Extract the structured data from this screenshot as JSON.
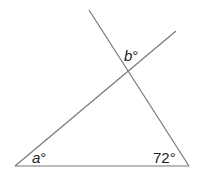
{
  "diagram": {
    "type": "geometry",
    "line_color": "#777777",
    "labels": {
      "a": "a",
      "b": "b",
      "angle_72": "72°",
      "degree": "°"
    },
    "lines": [
      {
        "name": "base",
        "x1": 15,
        "y1": 166,
        "x2": 189,
        "y2": 166
      },
      {
        "name": "transversal-right",
        "x1": 89,
        "y1": 10,
        "x2": 189,
        "y2": 166
      },
      {
        "name": "transversal-left",
        "x1": 15,
        "y1": 166,
        "x2": 176,
        "y2": 31
      }
    ]
  }
}
